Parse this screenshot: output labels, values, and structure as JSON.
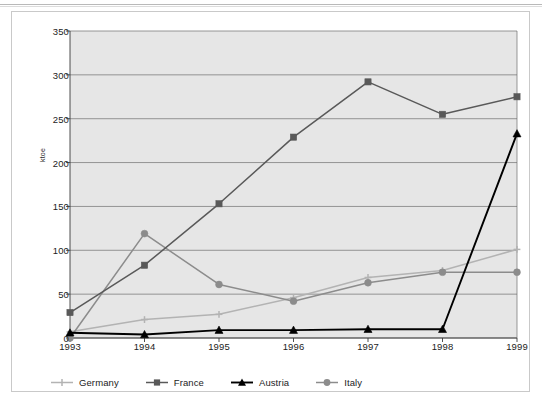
{
  "figure": {
    "y_axis_title": "ktoe",
    "plot_background": "#e6e6e6",
    "frame_color": "#c9c9c9"
  },
  "chart_data": {
    "type": "line",
    "title": "",
    "xlabel": "",
    "ylabel": "ktoe",
    "categories": [
      "1993",
      "1994",
      "1995",
      "1996",
      "1997",
      "1998",
      "1999"
    ],
    "x": [
      1993,
      1994,
      1995,
      1996,
      1997,
      1998,
      1999
    ],
    "ylim": [
      0,
      350
    ],
    "yticks": [
      0,
      50,
      100,
      150,
      200,
      250,
      300,
      350
    ],
    "grid": true,
    "legend_position": "bottom",
    "series": [
      {
        "name": "Germany",
        "color": "#b3b3b3",
        "marker": "cross",
        "values": [
          7,
          21,
          27,
          46,
          69,
          77,
          101
        ]
      },
      {
        "name": "France",
        "color": "#595959",
        "marker": "square",
        "values": [
          29,
          83,
          153,
          229,
          292,
          255,
          275
        ]
      },
      {
        "name": "Austria",
        "color": "#000000",
        "marker": "triangle",
        "values": [
          6,
          4,
          9,
          9,
          10,
          10,
          233
        ]
      },
      {
        "name": "Italy",
        "color": "#8c8c8c",
        "marker": "circle",
        "values": [
          0,
          119,
          61,
          42,
          63,
          75,
          75
        ]
      }
    ]
  }
}
